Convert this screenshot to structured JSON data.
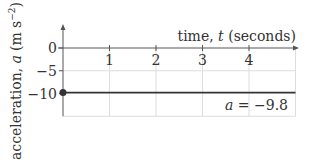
{
  "chart_data": {
    "type": "line",
    "title": "",
    "xlabel": "time, t (seconds)",
    "xlabel_parts": {
      "pre": "time, ",
      "var": "t",
      "post": " (seconds)"
    },
    "ylabel": "acceleration, a (m s^-2)",
    "ylabel_parts": {
      "pre": "acceleration, ",
      "var": "a",
      "unit": "(m s",
      "exp": "−2",
      "close": ")"
    },
    "xlim": [
      0,
      5
    ],
    "ylim": [
      -15,
      5
    ],
    "x_ticks": [
      1,
      2,
      3,
      4
    ],
    "x_tick_labels": [
      "1",
      "2",
      "3",
      "4"
    ],
    "y_ticks": [
      0,
      -5,
      -10
    ],
    "y_tick_labels": [
      "0",
      "−5",
      "−10"
    ],
    "grid": true,
    "grid_x": [
      1,
      2,
      3,
      4,
      5
    ],
    "grid_y": [
      -5,
      -15
    ],
    "series": [
      {
        "name": "a = -9.8",
        "x": [
          0,
          5
        ],
        "y": [
          -9.8,
          -9.8
        ],
        "start_marker": "filled-circle"
      }
    ],
    "annotations": [
      {
        "text_var": "a",
        "text_rest": " = −9.8",
        "x": 5,
        "y": -9.8,
        "placement": "below-right"
      }
    ],
    "colors": {
      "line": "#333333",
      "grid": "#dddddd",
      "axis": "#555555",
      "text": "#333333"
    }
  }
}
